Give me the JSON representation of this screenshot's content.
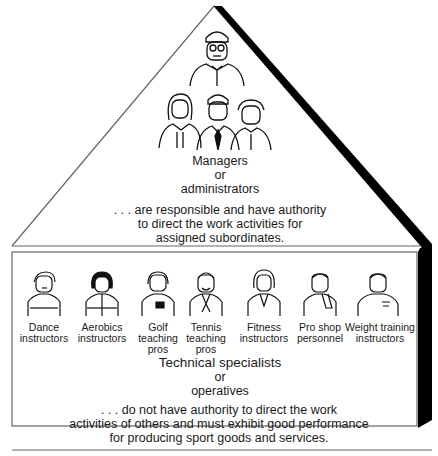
{
  "diagram": {
    "type": "hierarchy-pyramid",
    "top_tier": {
      "title_line1": "Managers",
      "title_line2": "or",
      "title_line3": "administrators",
      "desc_line1": ". . . are responsible and have authority",
      "desc_line2": "to direct the work activities for",
      "desc_line3": "assigned subordinates.",
      "figures": [
        "top-manager",
        "manager-woman",
        "manager-man",
        "manager-older"
      ]
    },
    "bottom_tier": {
      "title_line1": "Technical specialists",
      "title_line2": "or",
      "title_line3": "operatives",
      "desc_line1": ". . . do not have authority to direct the work",
      "desc_line2": "activities of others and must exhibit good performance",
      "desc_line3": "for producing sport goods and services.",
      "roles": [
        {
          "line1": "Dance",
          "line2": "instructors",
          "line3": ""
        },
        {
          "line1": "Aerobics",
          "line2": "instructors",
          "line3": ""
        },
        {
          "line1": "Golf",
          "line2": "teaching",
          "line3": "pros"
        },
        {
          "line1": "Tennis",
          "line2": "teaching",
          "line3": "pros"
        },
        {
          "line1": "Fitness",
          "line2": "instructors",
          "line3": ""
        },
        {
          "line1": "Pro shop",
          "line2": "personnel",
          "line3": ""
        },
        {
          "line1": "Weight training",
          "line2": "instructors",
          "line3": ""
        }
      ]
    },
    "colors": {
      "line": "#555555",
      "shadow": "#000000",
      "text": "#1a1a1a"
    }
  }
}
